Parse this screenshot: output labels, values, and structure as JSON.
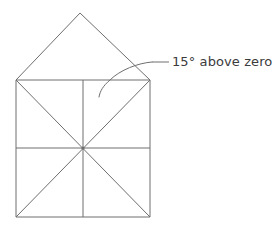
{
  "figure": {
    "background_color": "#ffffff",
    "line_color": "#6e6e6e",
    "text_color": "#3b3b3b"
  },
  "annotation": {
    "label": "15° above zero",
    "value": 15,
    "unit": "degrees",
    "qualifier": "above zero",
    "text_x": 172,
    "text_y": 66,
    "font_size": 13,
    "leader_line": {
      "straight_start_x": 152,
      "straight_start_y": 62,
      "straight_end_x": 169,
      "straight_end_y": 62,
      "curve_path": "M 152 62 C 138 63 120 70 110 80 C 103 86 100 91 99 97"
    }
  },
  "shapes": {
    "square": {
      "name": "square-body",
      "left": 16,
      "top": 80,
      "right": 150,
      "bottom": 217,
      "width": 134,
      "height": 137,
      "path": "M 16 80 L 150 80 L 150 217 L 16 217 Z"
    },
    "roof": {
      "name": "roof-triangle",
      "apex_x": 80,
      "apex_y": 13,
      "left_x": 16,
      "left_y": 80,
      "right_x": 150,
      "right_y": 80,
      "path": "M 16 80 L 80 13 L 150 80"
    },
    "diagonal_tlbr": {
      "name": "diagonal-top-left-to-bottom-right",
      "path": "M 16 80 L 150 217"
    },
    "diagonal_trbl": {
      "name": "diagonal-top-right-to-bottom-left",
      "path": "M 150 80 L 16 217"
    },
    "vertical_midline": {
      "name": "vertical-midline",
      "x": 83,
      "path": "M 83 80 L 83 217"
    },
    "horizontal_midline": {
      "name": "horizontal-midline",
      "y": 148,
      "path": "M 16 148 L 150 148"
    },
    "center_point": {
      "name": "center-point",
      "x": 83,
      "y": 148,
      "radius": 1.6
    }
  }
}
